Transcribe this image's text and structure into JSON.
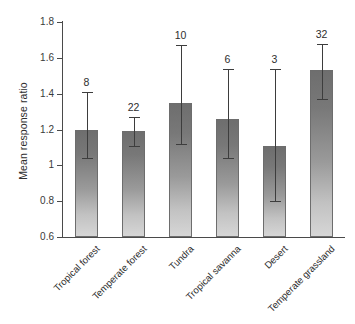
{
  "figure": {
    "background_color": "#ffffff",
    "axis_color": "#4a4a4a",
    "bar_fill_top": "#6e6e6e",
    "bar_fill_bottom": "#d6d6d6",
    "error_bar_color": "#3d3d3d"
  },
  "chart_data": {
    "type": "bar",
    "title": "",
    "xlabel": "",
    "ylabel": "Mean response ratio",
    "ylim": [
      0.6,
      1.8
    ],
    "yticks": [
      "0.6",
      "0.8",
      "1",
      "1.2",
      "1.4",
      "1.6",
      "1.8"
    ],
    "ytick_values": [
      0.6,
      0.8,
      1.0,
      1.2,
      1.4,
      1.6,
      1.8
    ],
    "grid": false,
    "legend": null,
    "categories": [
      "Tropical forest",
      "Temperate forest",
      "Tundra",
      "Tropical savanna",
      "Desert",
      "Temperate grassland"
    ],
    "values": [
      1.2,
      1.19,
      1.35,
      1.26,
      1.11,
      1.53
    ],
    "error_low": [
      1.04,
      1.11,
      1.12,
      1.04,
      0.8,
      1.37
    ],
    "error_high": [
      1.41,
      1.27,
      1.67,
      1.54,
      1.54,
      1.68
    ],
    "annotations": [
      "8",
      "22",
      "10",
      "6",
      "3",
      "32"
    ],
    "annotation_meaning": "number of studies"
  }
}
